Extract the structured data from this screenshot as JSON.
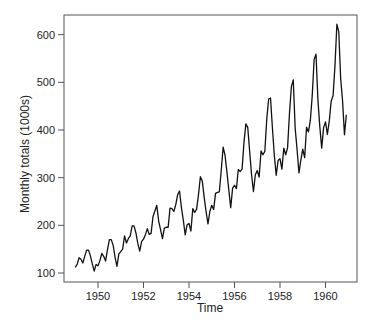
{
  "chart_data": {
    "type": "line",
    "title": "",
    "xlabel": "Time",
    "ylabel": "Monthly totals (1000s)",
    "xlim": [
      1948.6,
      1961.3
    ],
    "ylim": [
      82,
      640
    ],
    "x_ticks": [
      1950,
      1952,
      1954,
      1956,
      1958,
      1960
    ],
    "y_ticks": [
      100,
      200,
      300,
      400,
      500,
      600
    ],
    "grid": false,
    "legend": null,
    "x_start": 1949.0,
    "x_step": 0.0833333,
    "series": [
      {
        "name": "Monthly totals",
        "color": "#111111",
        "values": [
          112,
          118,
          132,
          129,
          121,
          135,
          148,
          148,
          136,
          119,
          104,
          118,
          115,
          126,
          141,
          135,
          125,
          149,
          170,
          170,
          158,
          133,
          114,
          140,
          145,
          150,
          178,
          163,
          172,
          178,
          199,
          199,
          184,
          162,
          146,
          166,
          171,
          180,
          193,
          181,
          183,
          218,
          230,
          242,
          209,
          191,
          172,
          194,
          196,
          196,
          236,
          235,
          229,
          243,
          264,
          272,
          237,
          211,
          180,
          201,
          204,
          188,
          235,
          227,
          234,
          264,
          302,
          293,
          259,
          229,
          203,
          229,
          242,
          233,
          267,
          269,
          270,
          315,
          364,
          347,
          312,
          274,
          237,
          278,
          284,
          277,
          317,
          313,
          318,
          374,
          413,
          405,
          355,
          306,
          271,
          306,
          315,
          301,
          356,
          348,
          355,
          422,
          465,
          467,
          404,
          347,
          305,
          336,
          340,
          318,
          362,
          348,
          363,
          435,
          491,
          505,
          404,
          359,
          310,
          337,
          360,
          342,
          406,
          396,
          420,
          472,
          548,
          559,
          463,
          407,
          362,
          405,
          417,
          391,
          419,
          461,
          472,
          535,
          622,
          606,
          508,
          461,
          390,
          432
        ]
      }
    ]
  },
  "axes": {
    "x_label": "Time",
    "y_label": "Monthly totals (1000s)"
  }
}
